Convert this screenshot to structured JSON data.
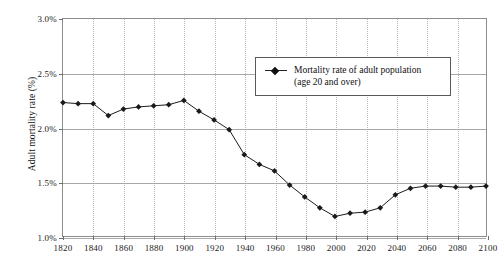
{
  "chart_data": {
    "type": "line",
    "title": "",
    "xlabel": "",
    "ylabel": "Adult mortality rate (%)",
    "xlim": [
      1820,
      2100
    ],
    "ylim": [
      1.0,
      3.0
    ],
    "y_tick_labels": [
      "3.0%",
      "2.5%",
      "2.0%",
      "1.5%",
      "1.0%"
    ],
    "y_ticks": [
      3.0,
      2.5,
      2.0,
      1.5,
      1.0
    ],
    "x_tick_labels": [
      "1820",
      "1840",
      "1860",
      "1880",
      "1900",
      "1920",
      "1940",
      "1960",
      "1980",
      "2000",
      "2020",
      "2040",
      "2060",
      "2080",
      "2100"
    ],
    "x_ticks": [
      1820,
      1840,
      1860,
      1880,
      1900,
      1920,
      1940,
      1960,
      1980,
      2000,
      2020,
      2040,
      2060,
      2080,
      2100
    ],
    "grid": "horizontal solid, vertical dotted",
    "legend_position": "upper right inside plot",
    "series": [
      {
        "name": "Mortality rate of adult population (age 20 and over)",
        "legend_line_1": "Mortality rate of adult population",
        "legend_line_2": "(age 20 and over)",
        "marker": "diamond",
        "color": "#1a1a1a",
        "x": [
          1820,
          1830,
          1840,
          1850,
          1860,
          1870,
          1880,
          1890,
          1900,
          1910,
          1920,
          1930,
          1940,
          1950,
          1960,
          1970,
          1980,
          1990,
          2000,
          2010,
          2020,
          2030,
          2040,
          2050,
          2060,
          2070,
          2080,
          2090,
          2100
        ],
        "values": [
          2.23,
          2.22,
          2.22,
          2.11,
          2.17,
          2.19,
          2.2,
          2.21,
          2.25,
          2.15,
          2.07,
          1.98,
          1.75,
          1.66,
          1.6,
          1.47,
          1.36,
          1.26,
          1.18,
          1.21,
          1.22,
          1.26,
          1.38,
          1.44,
          1.46,
          1.46,
          1.45,
          1.45,
          1.46
        ]
      }
    ]
  }
}
